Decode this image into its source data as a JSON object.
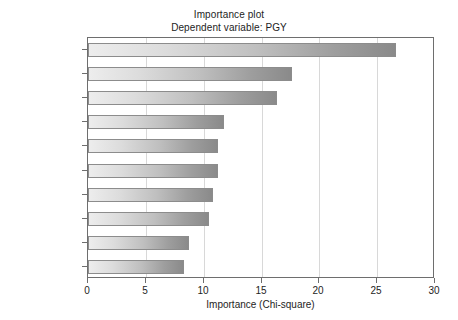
{
  "chart_data": {
    "type": "bar",
    "orientation": "horizontal",
    "title": "Importance plot",
    "subtitle": "Dependent variable: PGY",
    "xlabel": "Importance (Chi-square)",
    "ylabel": "",
    "xlim": [
      0,
      30
    ],
    "xticks": [
      0,
      5,
      10,
      15,
      20,
      25,
      30
    ],
    "xtick_labels": [
      "0",
      "5",
      "10",
      "15",
      "20",
      "25",
      "30"
    ],
    "grid": "vertical",
    "legend": "none",
    "categories": [
      "Self Care +",
      "Forgiveness +",
      "Perspective +",
      "Character +",
      "Order +",
      "Perspective –",
      "Forgiveness –",
      "Character –",
      "Spiritual +",
      "Biological +"
    ],
    "values": [
      26.6,
      17.6,
      16.3,
      11.8,
      11.2,
      11.2,
      10.8,
      10.5,
      8.7,
      8.3
    ],
    "bar_style": {
      "gradient_start": "#ededed",
      "gradient_end": "#8a8a8a",
      "border": "#8c8c8c"
    },
    "axis_color": "#6e6e6e",
    "grid_color": "#d8d8d8",
    "background": "#ffffff"
  }
}
